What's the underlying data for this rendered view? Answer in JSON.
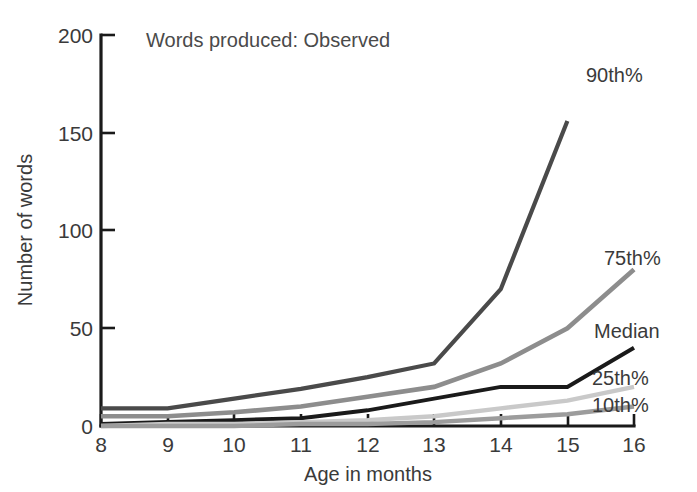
{
  "chart_data": {
    "type": "line",
    "title": "Words produced: Observed",
    "xlabel": "Age in months",
    "ylabel": "Number of words",
    "x": [
      8,
      9,
      10,
      11,
      12,
      13,
      14,
      15,
      16
    ],
    "xlim": [
      8,
      16
    ],
    "ylim": [
      0,
      200
    ],
    "xticks": [
      "8",
      "9",
      "10",
      "11",
      "12",
      "13",
      "14",
      "15",
      "16"
    ],
    "yticks": [
      "0",
      "50",
      "100",
      "150",
      "200"
    ],
    "ytick_values": [
      0,
      50,
      100,
      150,
      200
    ],
    "grid": false,
    "legend_position": "right-inline-labels",
    "series": [
      {
        "name": "90th%",
        "label": "90th%",
        "color": "#4a4a4a",
        "stroke_width": 4.2,
        "x": [
          8,
          9,
          10,
          11,
          12,
          13,
          14,
          15
        ],
        "values": [
          9,
          9,
          14,
          19,
          25,
          32,
          70,
          156
        ]
      },
      {
        "name": "75th%",
        "label": "75th%",
        "color": "#8d8d8d",
        "stroke_width": 4.6,
        "x": [
          8,
          9,
          10,
          11,
          12,
          13,
          14,
          15,
          16
        ],
        "values": [
          5,
          5,
          7,
          10,
          15,
          20,
          32,
          50,
          80
        ]
      },
      {
        "name": "Median",
        "label": "Median",
        "color": "#1a1a1a",
        "stroke_width": 4.0,
        "x": [
          8,
          9,
          10,
          11,
          12,
          13,
          14,
          15,
          16
        ],
        "values": [
          1,
          2,
          3,
          4,
          8,
          14,
          20,
          20,
          40
        ]
      },
      {
        "name": "25th%",
        "label": "25th%",
        "color": "#c9c9c9",
        "stroke_width": 4.4,
        "x": [
          8,
          9,
          10,
          11,
          12,
          13,
          14,
          15,
          16
        ],
        "values": [
          0,
          1,
          1,
          2,
          3,
          5,
          9,
          13,
          20
        ]
      },
      {
        "name": "10th%",
        "label": "10th%",
        "color": "#9c9c9c",
        "stroke_width": 4.4,
        "x": [
          8,
          9,
          10,
          11,
          12,
          13,
          14,
          15,
          16
        ],
        "values": [
          0,
          0,
          0,
          1,
          1,
          2,
          4,
          6,
          10
        ]
      }
    ],
    "annotations": [
      {
        "text": "90th%",
        "x_px": 586,
        "y_px": 82
      },
      {
        "text": "75th%",
        "x_px": 604,
        "y_px": 265
      },
      {
        "text": "Median",
        "x_px": 594,
        "y_px": 338
      },
      {
        "text": "25th%",
        "x_px": 592,
        "y_px": 385
      },
      {
        "text": "10th%",
        "x_px": 592,
        "y_px": 412
      }
    ]
  }
}
